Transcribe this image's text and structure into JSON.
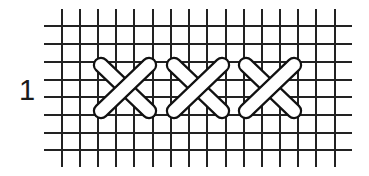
{
  "figure": {
    "row_label": "1",
    "stitch_type": "cross-stitch",
    "stitch_count": 3
  },
  "grid": {
    "vertical_lines_x": [
      62,
      80,
      98,
      116,
      134,
      153,
      171,
      189,
      207,
      226,
      244,
      262,
      280,
      298,
      316,
      335
    ],
    "vertical_line_y_range": [
      9,
      167
    ],
    "horizontal_lines_y": [
      26,
      44,
      62,
      80,
      97,
      115,
      133,
      150
    ],
    "horizontal_line_x_range": [
      44,
      352
    ],
    "line_color": "#222222",
    "line_width": 2
  },
  "stitches": [
    {
      "cx": 125,
      "cy": 88
    },
    {
      "cx": 198,
      "cy": 88
    },
    {
      "cx": 270,
      "cy": 88
    }
  ],
  "stitch_style": {
    "half_width": 30,
    "half_height": 29,
    "thickness": 12,
    "fill": "#ffffff",
    "outline": "#111111",
    "outline_width": 2.2
  }
}
